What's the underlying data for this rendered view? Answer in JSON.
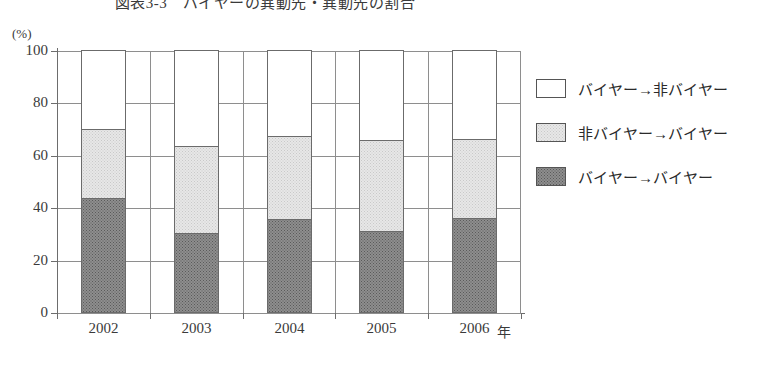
{
  "chart_title": "図表3-3　バイヤーの異動先・異動先の割合",
  "unit_label": "(%)",
  "x_axis_unit": "年",
  "y_ticks": [
    "100",
    "80",
    "60",
    "40",
    "20",
    "0"
  ],
  "legend": {
    "items": [
      {
        "label": "バイヤー→非バイヤー",
        "swatch": "white-square-icon",
        "color": "#ffffff"
      },
      {
        "label": "非バイヤー→バイヤー",
        "swatch": "light-gray-square-icon",
        "color": "#e7e7e7"
      },
      {
        "label": "バイヤー→バイヤー",
        "swatch": "dark-gray-square-icon",
        "color": "#8e8e8e"
      }
    ]
  },
  "chart_data": {
    "type": "bar",
    "subtype": "stacked-bar-100",
    "title": "図表3-3　バイヤーの異動先・異動先の割合",
    "xlabel": "年",
    "ylabel": "(%)",
    "ylim": [
      0,
      100
    ],
    "ytick_step": 20,
    "grid": true,
    "legend_position": "right",
    "categories": [
      "2002",
      "2003",
      "2004",
      "2005",
      "2006"
    ],
    "series": [
      {
        "name": "バイヤー→バイヤー",
        "values": [
          43.5,
          30.0,
          35.5,
          31.0,
          36.0
        ]
      },
      {
        "name": "非バイヤー→バイヤー",
        "values": [
          26.5,
          33.5,
          31.5,
          34.5,
          30.0
        ]
      },
      {
        "name": "バイヤー→非バイヤー",
        "values": [
          30.0,
          36.5,
          33.0,
          34.5,
          34.0
        ]
      }
    ],
    "cumulative_tops": {
      "バイヤー→バイヤー": [
        43.5,
        30.0,
        35.5,
        31.0,
        36.0
      ],
      "非バイヤー→バイヤー": [
        70.0,
        63.5,
        67.0,
        65.5,
        66.0
      ],
      "バイヤー→非バイヤー": [
        100,
        100,
        100,
        100,
        100
      ]
    }
  }
}
